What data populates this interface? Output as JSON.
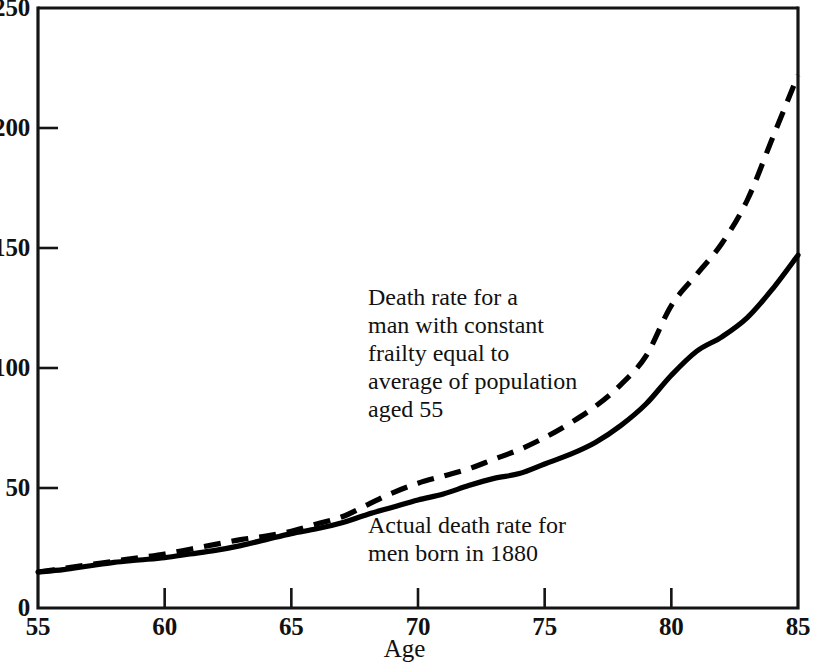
{
  "chart_data": {
    "type": "line",
    "title": "",
    "xlabel": "Age",
    "ylabel": "",
    "xlim": [
      55,
      85
    ],
    "ylim": [
      0,
      250
    ],
    "grid": false,
    "legend_position": "inline-annotations",
    "xticks": [
      55,
      60,
      65,
      70,
      75,
      80,
      85
    ],
    "xtick_labels": [
      "55",
      "60",
      "65",
      "70",
      "75",
      "80",
      "85"
    ],
    "yticks": [
      0,
      50,
      100,
      150,
      200,
      250
    ],
    "ytick_labels": [
      "0",
      "50",
      "100",
      "150",
      "200",
      "250"
    ],
    "x": [
      55,
      56,
      57,
      58,
      59,
      60,
      61,
      62,
      63,
      64,
      65,
      66,
      67,
      68,
      69,
      70,
      71,
      72,
      73,
      74,
      75,
      76,
      77,
      78,
      79,
      80,
      81,
      82,
      83,
      84,
      85
    ],
    "series": [
      {
        "name": "Actual death rate for men born in 1880",
        "style": "solid",
        "color": "#000000",
        "values": [
          15,
          16,
          17.5,
          19,
          20,
          21,
          22.5,
          24,
          26,
          28.5,
          31,
          33,
          35.5,
          39,
          42,
          45,
          47.5,
          51,
          54,
          56,
          60,
          64,
          69,
          76,
          85,
          97,
          107,
          113,
          121,
          133,
          147
        ]
      },
      {
        "name": "Death rate for a man with constant frailty equal to average of population aged 55",
        "style": "dashed",
        "color": "#000000",
        "values": [
          15,
          16.5,
          18,
          19.5,
          21,
          22.5,
          24.5,
          26.5,
          28.5,
          30,
          32,
          35,
          38,
          43,
          48,
          52,
          55,
          58,
          62,
          66,
          71,
          77,
          84,
          93,
          105,
          126,
          139,
          152,
          170,
          196,
          222
        ]
      }
    ],
    "annotations": [
      {
        "id": "annotation-dashed",
        "text": "Death rate for a\nman with constant\nfrailty equal to\naverage of population\naged 55",
        "refers_to": "dashed"
      },
      {
        "id": "annotation-solid",
        "text": "Actual death rate for\nmen born in 1880",
        "refers_to": "solid"
      }
    ]
  },
  "axes": {
    "x_title": "Age"
  }
}
